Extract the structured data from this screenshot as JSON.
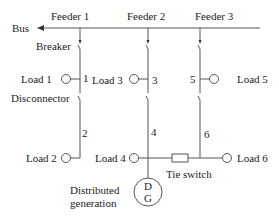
{
  "diagram": {
    "bus_label": "Bus",
    "feeders": [
      "Feeder 1",
      "Feeder 2",
      "Feeder 3"
    ],
    "breaker_label": "Breaker",
    "disconnector_label": "Disconnector",
    "loads": [
      "Load 1",
      "Load 2",
      "Load 3",
      "Load 4",
      "Load 5",
      "Load 6"
    ],
    "nodes": [
      "1",
      "2",
      "3",
      "4",
      "5",
      "6"
    ],
    "tie_switch_label": "Tie switch",
    "dg_label_line1": "Distributed",
    "dg_label_line2": "generation",
    "dg_symbol_top": "D",
    "dg_symbol_bottom": "G",
    "line_color": "#555555"
  }
}
